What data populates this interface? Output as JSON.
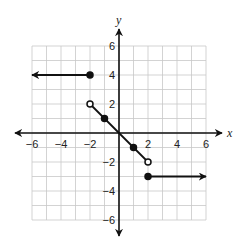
{
  "chart_data": {
    "type": "line",
    "title": "",
    "xlabel": "x",
    "ylabel": "y",
    "xlim": [
      -6,
      6
    ],
    "ylim": [
      -6,
      6
    ],
    "grid": true,
    "x_ticks": [
      -6,
      -4,
      -2,
      2,
      4,
      6
    ],
    "y_ticks": [
      6,
      4,
      2,
      -2,
      -4,
      -6
    ],
    "x_tick_labels": [
      "−6",
      "−4",
      "−2",
      "2",
      "4",
      "6"
    ],
    "y_tick_labels": [
      "6",
      "4",
      "2",
      "−2",
      "−4",
      "−6"
    ],
    "pieces": [
      {
        "name": "left-ray",
        "description": "y = 4 for x <= -2",
        "from": [
          -2,
          4
        ],
        "to": [
          -6,
          4
        ],
        "start_point": "closed",
        "arrow": "left"
      },
      {
        "name": "middle-segment",
        "description": "y = -x for -2 < x < 2",
        "from": [
          -2,
          2
        ],
        "to": [
          2,
          -2
        ],
        "start_point": "open",
        "end_point": "open",
        "marked_points": [
          [
            -1,
            1
          ],
          [
            0,
            0
          ],
          [
            1,
            -1
          ]
        ]
      },
      {
        "name": "right-ray",
        "description": "y = -3 for x >= 2",
        "from": [
          2,
          -3
        ],
        "to": [
          6,
          -3
        ],
        "start_point": "closed",
        "arrow": "right"
      }
    ],
    "points": [
      {
        "x": -2,
        "y": 4,
        "style": "closed"
      },
      {
        "x": -2,
        "y": 2,
        "style": "open"
      },
      {
        "x": -1,
        "y": 1,
        "style": "closed"
      },
      {
        "x": 1,
        "y": -1,
        "style": "closed"
      },
      {
        "x": 2,
        "y": -2,
        "style": "open"
      },
      {
        "x": 2,
        "y": -3,
        "style": "closed"
      }
    ]
  },
  "colors": {
    "grid": "#c8c8c8",
    "axis": "#111111",
    "graph": "#111111",
    "background": "#ffffff"
  }
}
